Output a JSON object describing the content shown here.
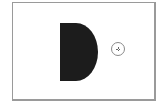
{
  "canvas": {
    "frame_color": "#9a9a9a",
    "background": "#ffffff"
  },
  "shape": {
    "type": "d-shape",
    "color": "#1c1c1c"
  },
  "cursor": {
    "icon": "crosshair-target-icon",
    "color": "#8a8a8a"
  }
}
